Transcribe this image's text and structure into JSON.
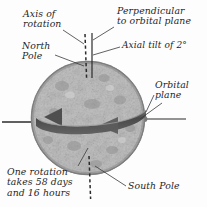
{
  "diagram": {
    "title_present": false,
    "background_color": "#fdfdfd",
    "ink_color": "#1d1d1d",
    "sphere": {
      "name": "planet-body",
      "center_x": 88,
      "center_y": 118,
      "radius": 57,
      "surface": "cratered-speckled-gray",
      "base_color": "#b9b9b9",
      "shadow_color": "#7c7c7c",
      "highlight_color": "#dcdcdc"
    },
    "orbital_band": {
      "name": "orbital-plane-band",
      "color": "#555555",
      "highlight": "#8a8a8a",
      "direction": "leftward",
      "arrowheads": 2
    },
    "axis_line": {
      "name": "axis-of-rotation-line",
      "style": "dashed",
      "tilt_degrees": 2
    },
    "perpendicular_line": {
      "name": "perpendicular-line",
      "style": "solid",
      "tilt_degrees": 0
    },
    "labels": {
      "axis_of_rotation": "Axis of\nrotation",
      "perpendicular": "Perpendicular\nto orbital plane",
      "axial_tilt": "Axial tilt of 2°",
      "north_pole": "North\nPole",
      "orbital_plane": "Orbital\nplane",
      "south_pole": "South Pole",
      "rotation_period": "One rotation\ntakes 58 days\nand 16 hours"
    }
  }
}
